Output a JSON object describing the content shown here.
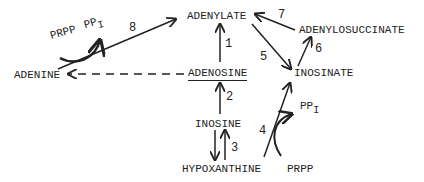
{
  "diagram": {
    "nodes": {
      "adenylate": "ADENYLATE",
      "adenylosuccinate": "ADENYLOSUCCINATE",
      "adenine": "ADENINE",
      "adenosine": "ADENOSINE",
      "inosinate": "INOSINATE",
      "inosine": "INOSINE",
      "hypoxanthine": "HYPOXANTHINE",
      "prpp_bottom": "PRPP"
    },
    "cofactors": {
      "prpp_top": "PRPP",
      "ppi_top_main": "PP",
      "ppi_top_sub": "I",
      "ppi_bottom_main": "PP",
      "ppi_bottom_sub": "I"
    },
    "edge_labels": {
      "e1": "1",
      "e2": "2",
      "e3": "3",
      "e4": "4",
      "e5": "5",
      "e6": "6",
      "e7": "7",
      "e8": "8"
    },
    "edges": [
      {
        "id": "1",
        "from": "ADENOSINE",
        "to": "ADENYLATE"
      },
      {
        "id": "2",
        "from": "INOSINE",
        "to": "ADENOSINE"
      },
      {
        "id": "3",
        "from": "INOSINE",
        "to": "HYPOXANTHINE",
        "bidirectional": true
      },
      {
        "id": "4",
        "from": "HYPOXANTHINE",
        "to": "INOSINATE",
        "consumes": "PRPP",
        "releases": "PPI"
      },
      {
        "id": "5",
        "from": "ADENYLATE",
        "to": "INOSINATE"
      },
      {
        "id": "6",
        "from": "INOSINATE",
        "to": "ADENYLOSUCCINATE"
      },
      {
        "id": "7",
        "from": "ADENYLOSUCCINATE",
        "to": "ADENYLATE"
      },
      {
        "id": "8",
        "from": "ADENINE",
        "to": "ADENYLATE",
        "consumes": "PRPP",
        "releases": "PPI"
      },
      {
        "id": "dashed",
        "from": "ADENOSINE",
        "to": "ADENINE",
        "style": "dashed"
      }
    ],
    "colors": {
      "ink": "#222222",
      "background": "#ffffff"
    }
  }
}
